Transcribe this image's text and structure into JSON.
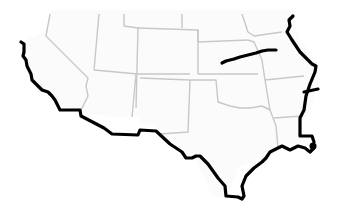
{
  "map": {
    "region": "Southwestern and South-Central United States",
    "background_color": "#ffffff",
    "land_color": "#fbfbfb",
    "state_border_color": "#c8c8c8",
    "highlight_line_color": "#000000",
    "labels": []
  }
}
